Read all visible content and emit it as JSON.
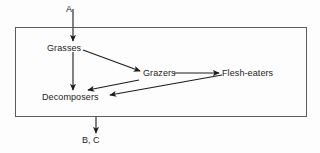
{
  "diagram": {
    "boundary": {
      "name": "ecosystem-boundary",
      "stroke": "#5b5b5b"
    },
    "nodes": [
      {
        "id": "grasses",
        "label": "Grasses"
      },
      {
        "id": "grazers",
        "label": "Grazers"
      },
      {
        "id": "flesh_eaters",
        "label": "Flesh-eaters"
      },
      {
        "id": "decomposers",
        "label": "Decomposers"
      }
    ],
    "external": [
      {
        "id": "input_a",
        "label": "A",
        "role": "input"
      },
      {
        "id": "output_bc",
        "label": "B, C",
        "role": "output"
      }
    ],
    "edges": [
      {
        "from": "input_a",
        "to": "grasses"
      },
      {
        "from": "grasses",
        "to": "grazers"
      },
      {
        "from": "grasses",
        "to": "decomposers"
      },
      {
        "from": "grazers",
        "to": "flesh_eaters"
      },
      {
        "from": "grazers",
        "to": "decomposers"
      },
      {
        "from": "flesh_eaters",
        "to": "decomposers"
      },
      {
        "from": "decomposers",
        "to": "output_bc"
      }
    ],
    "colors": {
      "stroke": "#1c1c1c",
      "background": "#fdfdfd",
      "text": "#1c1c1c"
    }
  }
}
